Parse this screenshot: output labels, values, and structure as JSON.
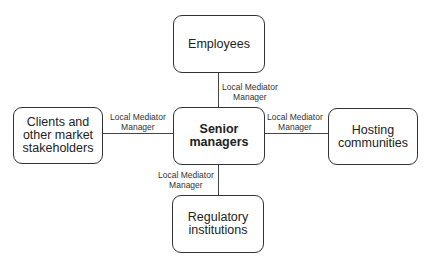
{
  "diagram": {
    "nodes": {
      "center": "Senior\nmanagers",
      "top": "Employees",
      "left": "Clients and\nother market\nstakeholders",
      "right": "Hosting\ncommunities",
      "bottom": "Regulatory\ninstitutions"
    },
    "edge_labels": {
      "top": "Local Mediator\nManager",
      "left": "Local Mediator\nManager",
      "right": "Local Mediator\nManager",
      "bottom": "Local Mediator\nManager"
    }
  }
}
